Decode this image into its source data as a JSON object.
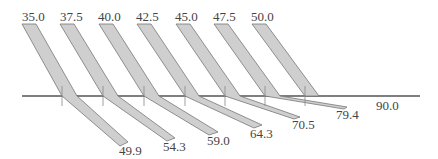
{
  "colors": {
    "beam_fill": "#cfcfcf",
    "beam_stroke": "#777777",
    "interface": "#555555",
    "normal": "#888888",
    "text": "#444444",
    "background": "#ffffff"
  },
  "incident_angles": [
    "35.0",
    "37.5",
    "40.0",
    "42.5",
    "45.0",
    "47.5",
    "50.0"
  ],
  "refracted_angles": [
    "49.9",
    "54.3",
    "59.0",
    "64.3",
    "70.5",
    "79.4"
  ],
  "grazing_angle": "90.0",
  "beams": [
    {
      "incident": "35.0",
      "refracted": "49.9",
      "label_top": {
        "x": 22,
        "y": 10
      },
      "label_bottom": {
        "x": 119,
        "y": 145
      }
    },
    {
      "incident": "37.5",
      "refracted": "54.3",
      "label_top": {
        "x": 60,
        "y": 10
      },
      "label_bottom": {
        "x": 163,
        "y": 141
      }
    },
    {
      "incident": "40.0",
      "refracted": "59.0",
      "label_top": {
        "x": 98,
        "y": 10
      },
      "label_bottom": {
        "x": 207,
        "y": 135
      }
    },
    {
      "incident": "42.5",
      "refracted": "64.3",
      "label_top": {
        "x": 136,
        "y": 10
      },
      "label_bottom": {
        "x": 250,
        "y": 127
      }
    },
    {
      "incident": "45.0",
      "refracted": "70.5",
      "label_top": {
        "x": 175,
        "y": 10
      },
      "label_bottom": {
        "x": 292,
        "y": 118
      }
    },
    {
      "incident": "47.5",
      "refracted": "79.4",
      "label_top": {
        "x": 213,
        "y": 10
      },
      "label_bottom": {
        "x": 336,
        "y": 105
      }
    },
    {
      "incident": "50.0",
      "refracted": "90.0",
      "label_top": {
        "x": 251,
        "y": 10
      },
      "label_bottom": {
        "x": 376,
        "y": 100
      }
    }
  ]
}
